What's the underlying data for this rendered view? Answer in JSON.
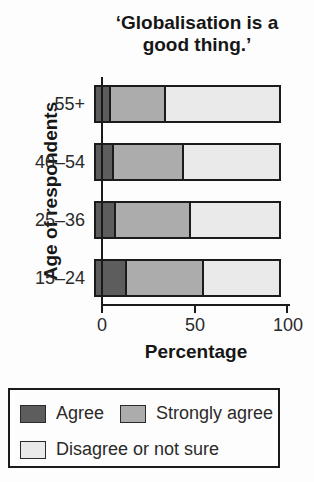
{
  "title": {
    "line1": "‘Globalisation is a",
    "line2": "good thing.’"
  },
  "chart_data": {
    "type": "bar",
    "orientation": "horizontal",
    "stacked": true,
    "title": "‘Globalisation is a good thing.’",
    "xlabel": "Percentage",
    "ylabel": "Age of respondents",
    "categories": [
      "55+",
      "40–54",
      "25–36",
      "15–24"
    ],
    "series": [
      {
        "name": "Agree",
        "color": "#5d5d5d",
        "values": [
          8,
          10,
          11,
          17
        ]
      },
      {
        "name": "Strongly agree",
        "color": "#acacac",
        "values": [
          30,
          38,
          41,
          42
        ]
      },
      {
        "name": "Disagree or not sure",
        "color": "#eaeaea",
        "values": [
          62,
          52,
          48,
          41
        ]
      }
    ],
    "xlim": [
      0,
      100
    ],
    "xticks": [
      "0",
      "50",
      "100"
    ],
    "grid": "off",
    "legend_position": "bottom"
  }
}
